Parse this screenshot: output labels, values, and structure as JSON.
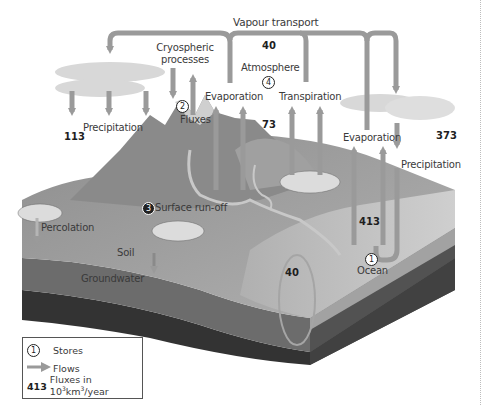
{
  "title": "Vapour transport",
  "labels": {
    "vapour_transport": "Vapour transport",
    "cryospheric_processes_line1": "Cryospheric",
    "cryospheric_processes_line2": "processes",
    "atmosphere": "Atmosphere",
    "evaporation_land": "Evaporation",
    "transpiration": "Transpiration",
    "evaporation_ocean": "Evaporation",
    "precipitation_land": "Precipitation",
    "precipitation_ocean": "Precipitation",
    "fluxes": "Fluxes",
    "surface_runoff": "Surface run-off",
    "percolation": "Percolation",
    "soil": "Soil",
    "groundwater": "Groundwater",
    "ocean": "Ocean"
  },
  "stores": [
    {
      "id": "1",
      "name": "Ocean"
    },
    {
      "id": "2",
      "name": "Fluxes"
    },
    {
      "id": "3",
      "name": "Surface run-off"
    },
    {
      "id": "4",
      "name": "Atmosphere"
    }
  ],
  "fluxes": {
    "vapour_transport": "40",
    "land_precipitation": "113",
    "land_evapotranspiration": "73",
    "ocean_precipitation": "373",
    "ocean_evaporation": "413",
    "runoff_return": "40"
  },
  "legend": {
    "stores_symbol": "1",
    "stores_label": "Stores",
    "flows_label": "Flows",
    "flux_example_value": "413",
    "flux_label_prefix": "Fluxes in 10",
    "flux_label_exp1": "3",
    "flux_label_mid": "km",
    "flux_label_exp2": "3",
    "flux_label_suffix": "/year"
  },
  "colors": {
    "arrow": "#9a9a9a",
    "land": "#9c9c9c",
    "soil": "#7e7e7e",
    "groundwater": "#3a3a3a",
    "ocean_surface": "#c4c4c4",
    "cloud": "#d8d8d8"
  }
}
